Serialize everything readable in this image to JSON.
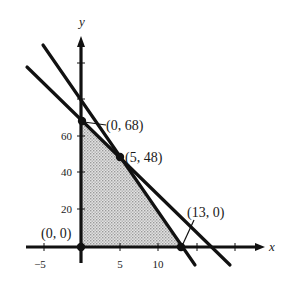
{
  "figure": {
    "type": "feasible-region-graph",
    "axes": {
      "x_label": "x",
      "y_label": "y",
      "x_ticks": [
        {
          "value": -5,
          "label": "−5"
        },
        {
          "value": 5,
          "label": "5"
        },
        {
          "value": 10,
          "label": "10"
        },
        {
          "value": 15,
          "label": ""
        },
        {
          "value": 20,
          "label": ""
        }
      ],
      "y_ticks": [
        {
          "value": 20,
          "label": "20"
        },
        {
          "value": 40,
          "label": "40"
        },
        {
          "value": 60,
          "label": "60"
        },
        {
          "value": 80,
          "label": ""
        },
        {
          "value": 100,
          "label": ""
        }
      ]
    },
    "lines": [
      {
        "name": "steep-constraint",
        "equation": "6x + y = 78",
        "points": [
          [
            5,
            48
          ],
          [
            13,
            0
          ]
        ]
      },
      {
        "name": "shallow-constraint",
        "equation": "4x + y = 68",
        "points": [
          [
            0,
            68
          ],
          [
            5,
            48
          ]
        ]
      }
    ],
    "vertices": [
      {
        "label": "(0, 0)",
        "x": 0,
        "y": 0
      },
      {
        "label": "(0, 68)",
        "x": 0,
        "y": 68
      },
      {
        "label": "(5, 48)",
        "x": 5,
        "y": 48
      },
      {
        "label": "(13, 0)",
        "x": 13,
        "y": 0
      }
    ],
    "shaded_region": "feasible region bounded by (0,0), (0,68), (5,48), (13,0)",
    "colors": {
      "ink": "#111111",
      "shade": "#c8c8c8"
    }
  }
}
